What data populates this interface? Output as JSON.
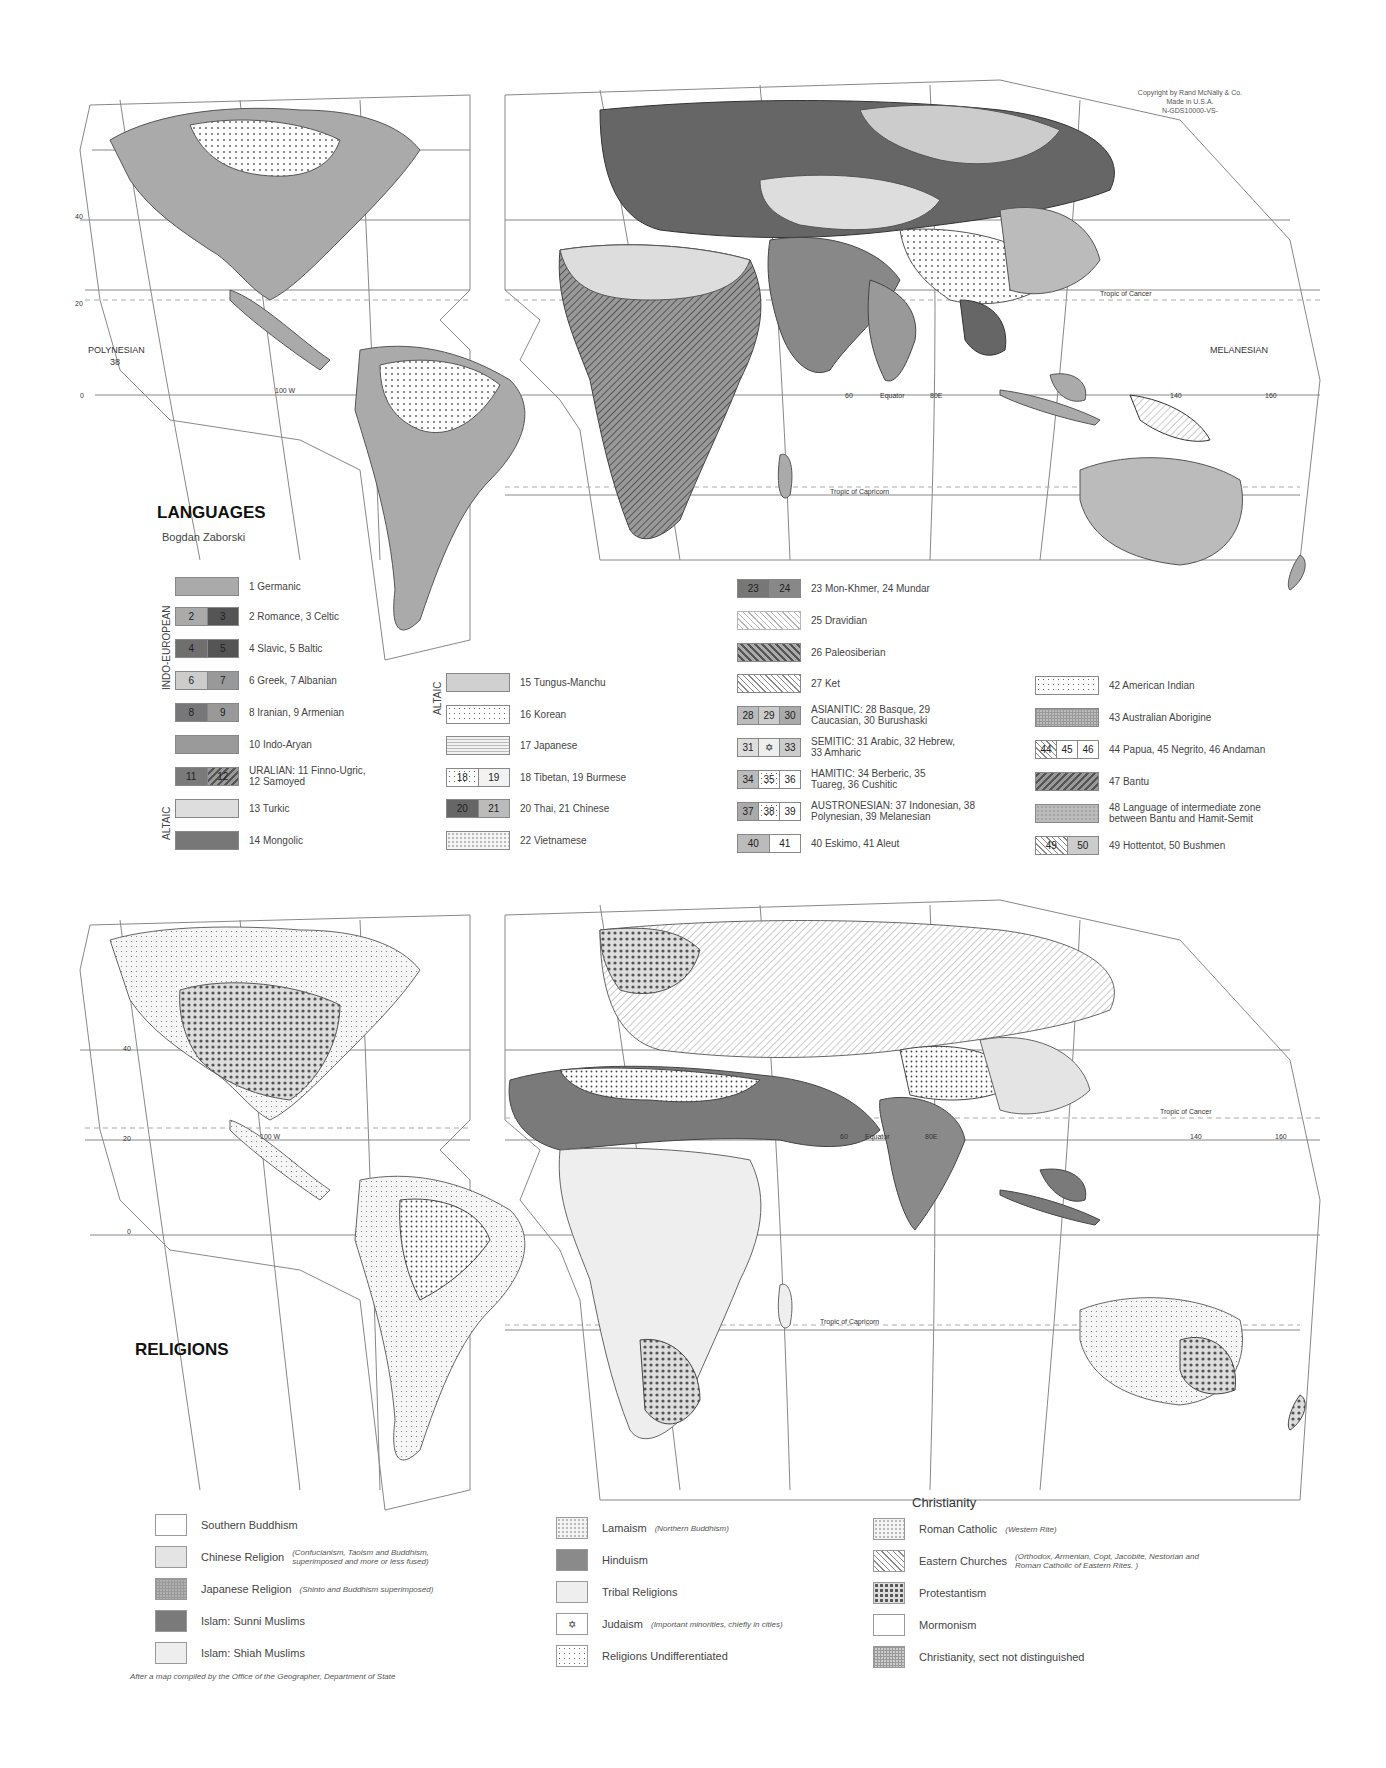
{
  "copyright": {
    "line1": "Copyright by Rand McNally & Co.",
    "line2": "Made in U.S.A.",
    "line3": "N-GDS10000-VS-"
  },
  "languages_map": {
    "title": "LANGUAGES",
    "author": "Bogdan Zaborski",
    "map_labels": {
      "polynesian": "POLYNESIAN",
      "polynesian_num": "38",
      "melanesian": "MELANESIAN",
      "indonesian": "I N D O N E S I A N",
      "equator": "Equator",
      "tropic_cancer": "Tropic of Cancer",
      "tropic_capricorn": "Tropic of Capricorn",
      "arctic_circle": "Arctic Circle",
      "lon_100w": "100 W",
      "lon_80": "80",
      "lon_60": "60",
      "lon_80e": "80E",
      "lon_140": "140",
      "lon_160": "160",
      "lat_40": "40",
      "lat_20": "20",
      "lat_0": "0",
      "lat_60": "60",
      "inset_160": "160",
      "inset_20": "20",
      "inset_38": "38"
    },
    "legend_groups": {
      "indo_european": "INDO-EUROPEAN",
      "altaic_1": "ALTAIC",
      "altaic_2": "ALTAIC"
    },
    "legend": [
      {
        "nums": [
          ""
        ],
        "label": "1 Germanic",
        "fill": "#aaaaaa"
      },
      {
        "nums": [
          "2",
          "3"
        ],
        "label": "2 Romance, 3 Celtic",
        "fill": "#a8a8a8",
        "fill2": "#555555"
      },
      {
        "nums": [
          "4",
          "5"
        ],
        "label": "4 Slavic, 5 Baltic",
        "fill": "#6f6f6f",
        "fill2": "#555555"
      },
      {
        "nums": [
          "6",
          "7"
        ],
        "label": "6 Greek, 7 Albanian",
        "fill": "#cccccc",
        "fill2": "#999999"
      },
      {
        "nums": [
          "8",
          "9"
        ],
        "label": "8 Iranian, 9 Armenian",
        "fill": "#777777",
        "fill2": "#999999"
      },
      {
        "nums": [
          ""
        ],
        "label": "10 Indo-Aryan",
        "fill": "#9a9a9a"
      },
      {
        "nums": [
          "11",
          "12"
        ],
        "label": "URALIAN:  11 Finno-Ugric, 12 Samoyed",
        "fill": "#7a7a7a"
      },
      {
        "nums": [
          ""
        ],
        "label": "13 Turkic",
        "fill": "#dddddd"
      },
      {
        "nums": [
          ""
        ],
        "label": "14 Mongolic",
        "fill": "#777777"
      },
      {
        "nums": [
          ""
        ],
        "label": "15 Tungus-Manchu",
        "fill": "#d0d0d0"
      },
      {
        "nums": [
          ""
        ],
        "label": "16 Korean",
        "fill": "#e0e0e0"
      },
      {
        "nums": [
          ""
        ],
        "label": "17 Japanese",
        "fill": "#eeeeee"
      },
      {
        "nums": [
          "18",
          "19"
        ],
        "label": "18 Tibetan, 19 Burmese",
        "fill": "#e6e6e6",
        "fill2": "#f2f2f2"
      },
      {
        "nums": [
          "20",
          "21"
        ],
        "label": "20 Thai, 21 Chinese",
        "fill": "#666666",
        "fill2": "#bbbbbb"
      },
      {
        "nums": [
          ""
        ],
        "label": "22 Vietnamese",
        "fill": "#f0f0f0"
      },
      {
        "nums": [
          "23",
          "24"
        ],
        "label": "23 Mon-Khmer, 24 Mundar",
        "fill": "#777777",
        "fill2": "#888888"
      },
      {
        "nums": [
          ""
        ],
        "label": "25 Dravidian",
        "fill": "#f2f2f2"
      },
      {
        "nums": [
          ""
        ],
        "label": "26 Paleosiberian",
        "fill": "#888888"
      },
      {
        "nums": [
          ""
        ],
        "label": "27 Ket",
        "fill": "#ffffff"
      },
      {
        "nums": [
          "28",
          "29",
          "30"
        ],
        "label": "ASIANITIC:  28 Basque, 29 Caucasian, 30 Burushaski",
        "fill": "#bbbbbb"
      },
      {
        "nums": [
          "31",
          "✡",
          "33"
        ],
        "label": "SEMITIC:  31 Arabic, 32 Hebrew, 33 Amharic",
        "fill": "#dddddd"
      },
      {
        "nums": [
          "34",
          "35",
          "36"
        ],
        "label": "HAMITIC:  34 Berberic, 35 Tuareg, 36 Cushitic",
        "fill": "#bbbbbb"
      },
      {
        "nums": [
          "37",
          "38",
          "39"
        ],
        "label": "AUSTRONESIAN:  37 Indonesian, 38 Polynesian, 39 Melanesian",
        "fill": "#aaaaaa"
      },
      {
        "nums": [
          "40",
          "41"
        ],
        "label": "40 Eskimo, 41 Aleut",
        "fill": "#bbbbbb",
        "fill2": "#ffffff"
      },
      {
        "nums": [
          ""
        ],
        "label": "42 American Indian",
        "fill": "#ffffff"
      },
      {
        "nums": [
          ""
        ],
        "label": "43 Australian Aborigine",
        "fill": "#bbbbbb"
      },
      {
        "nums": [
          "44",
          "45",
          "46"
        ],
        "label": "44 Papua, 45 Negrito, 46 Andaman",
        "fill": "#ffffff"
      },
      {
        "nums": [
          ""
        ],
        "label": "47 Bantu",
        "fill": "#888888"
      },
      {
        "nums": [
          ""
        ],
        "label": "48 Language of intermediate zone between Bantu and Hamit-Semit",
        "fill": "#aaaaaa"
      },
      {
        "nums": [
          "49",
          "50"
        ],
        "label": "49 Hottentot, 50 Bushmen",
        "fill": "#cccccc"
      }
    ]
  },
  "religions_map": {
    "title": "RELIGIONS",
    "christianity_heading": "Christianity",
    "map_labels": {
      "equator": "Equator",
      "tropic_cancer": "Tropic of Cancer",
      "tropic_capricorn": "Tropic of Capricorn",
      "lon_100w": "100 W",
      "lon_80": "80",
      "lon_0": "0",
      "lon_20": "20",
      "lon_60": "60",
      "lon_80e": "80E",
      "lon_140": "140",
      "lon_160": "160",
      "lat_40": "40",
      "lat_20": "20",
      "lat_0": "0",
      "lat_60": "60",
      "inset_160": "160",
      "inset_20": "20"
    },
    "legend": [
      {
        "label": "Southern Buddhism",
        "note": "",
        "fill": "#ffffff"
      },
      {
        "label": "Chinese Religion",
        "note": "(Confucianism, Taoism and Buddhism, superimposed and more or less fused)",
        "fill": "#e4e4e4"
      },
      {
        "label": "Japanese Religion",
        "note": "(Shinto and Buddhism superimposed)",
        "fill": "#b0b0b0"
      },
      {
        "label": "Islam: Sunni Muslims",
        "note": "",
        "fill": "#7a7a7a"
      },
      {
        "label": "Islam: Shiah Muslims",
        "note": "",
        "fill": "#eeeeee"
      },
      {
        "label": "Lamaism",
        "note": "(Northern Buddhism)",
        "fill": "#f6f6f6"
      },
      {
        "label": "Hinduism",
        "note": "",
        "fill": "#8a8a8a"
      },
      {
        "label": "Tribal Religions",
        "note": "",
        "fill": "#eeeeee"
      },
      {
        "label": "Judaism",
        "note": "(Important minorities, chiefly in cities)",
        "fill": "#ffffff",
        "symbol": "✡"
      },
      {
        "label": "Religions Undifferentiated",
        "note": "",
        "fill": "#ffffff"
      },
      {
        "label": "Roman Catholic",
        "note": "(Western Rite)",
        "fill": "#f4f4f4"
      },
      {
        "label": "Eastern Churches",
        "note": "(Orthodox, Armenian, Copt, Jacobite, Nestorian and Roman Catholic of Eastern Rites. )",
        "fill": "#ffffff"
      },
      {
        "label": "Protestantism",
        "note": "",
        "fill": "#999999"
      },
      {
        "label": "Mormonism",
        "note": "",
        "fill": "#ffffff"
      },
      {
        "label": "Christianity, sect not distinguished",
        "note": "",
        "fill": "#cccccc"
      }
    ],
    "footer": "After a map compiled by the Office of the Geographer, Department of State"
  }
}
